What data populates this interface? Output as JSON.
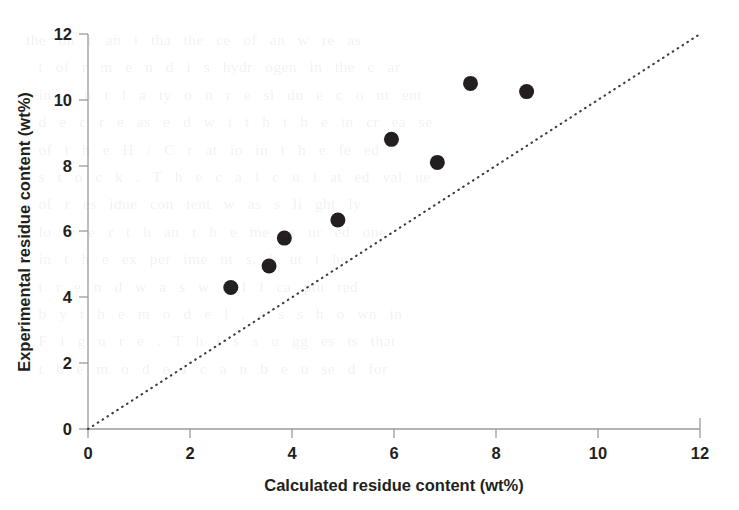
{
  "figure": {
    "background_color": "#ffffff",
    "marker_color": "#231f20",
    "axis_color": "#9a9a98",
    "parity_line_color": "#3d3d3d"
  },
  "background_text": {
    "note": "faint show-through text from the reverse side of the printed page",
    "content": "the  on  r  an  i  tha  the  ce  of  an  w  re  as\n  t  of  r  m  e  n  d  i  s  hydr  ogen  in  the  c  ar\n  in  e  n  t  l  a  ty  o  n  r  e  si  du  e  c  o  nt  ent\n  d  e  c  r  e  as  e  d  w  i  t  h  t  h  e  in  cr  ea  se\n  of  t  h  e  H  /  C  r  at  io  in  t  h  e  fe  ed\n  s  t  o  c  k  .  T  h  e  c  a  l  c  u  l  at  ed  val  ue\n  of  r  es  idue  con  tent  w  as  s  li  ght  ly\n  lo  w  e  r  t  h  an  t  h  e  me  as  ur  ed  one\n  in  t  h  e  ex  per  ime  nt  s,  b  ut  t  he\n  t  r  e  n  d  w  a  s  w  e  l  l  ca  ptu  red\n  b  y  t  h  e  m  o  d  e  l  ,  a  s  s  h  o  wn  in\n  F  i  g  u  r  e  .  T  h  i  s  s  u  gg  es  ts  that\n  t  h  e  m  o  d  e  l  c  a  n  b  e  u  se  d  for"
  },
  "chart_data": {
    "type": "scatter",
    "title": "",
    "xlabel": "Calculated residue content (wt%)",
    "ylabel": "Experimental residue content (wt%)",
    "xlim": [
      0,
      12
    ],
    "ylim": [
      0,
      12
    ],
    "xticks": [
      0,
      2,
      4,
      6,
      8,
      10,
      12
    ],
    "yticks": [
      0,
      2,
      4,
      6,
      8,
      10,
      12
    ],
    "xtick_labels": [
      "0",
      "2",
      "4",
      "6",
      "8",
      "10",
      "12"
    ],
    "ytick_labels": [
      "0",
      "2",
      "4",
      "6",
      "8",
      "10",
      "12"
    ],
    "grid": false,
    "legend": null,
    "series": [
      {
        "name": "residue content",
        "marker": "filled-circle",
        "marker_color": "#231f20",
        "marker_size": 15,
        "points": [
          {
            "x": 2.8,
            "y": 4.3
          },
          {
            "x": 3.55,
            "y": 4.95
          },
          {
            "x": 3.85,
            "y": 5.8
          },
          {
            "x": 4.9,
            "y": 6.35
          },
          {
            "x": 5.95,
            "y": 8.8
          },
          {
            "x": 6.85,
            "y": 8.1
          },
          {
            "x": 7.5,
            "y": 10.5
          },
          {
            "x": 8.6,
            "y": 10.25
          }
        ]
      }
    ],
    "reference_line": {
      "name": "parity-line",
      "style": "dotted",
      "from": [
        0,
        0
      ],
      "to": [
        12,
        12
      ],
      "color": "#3d3d3d"
    }
  }
}
